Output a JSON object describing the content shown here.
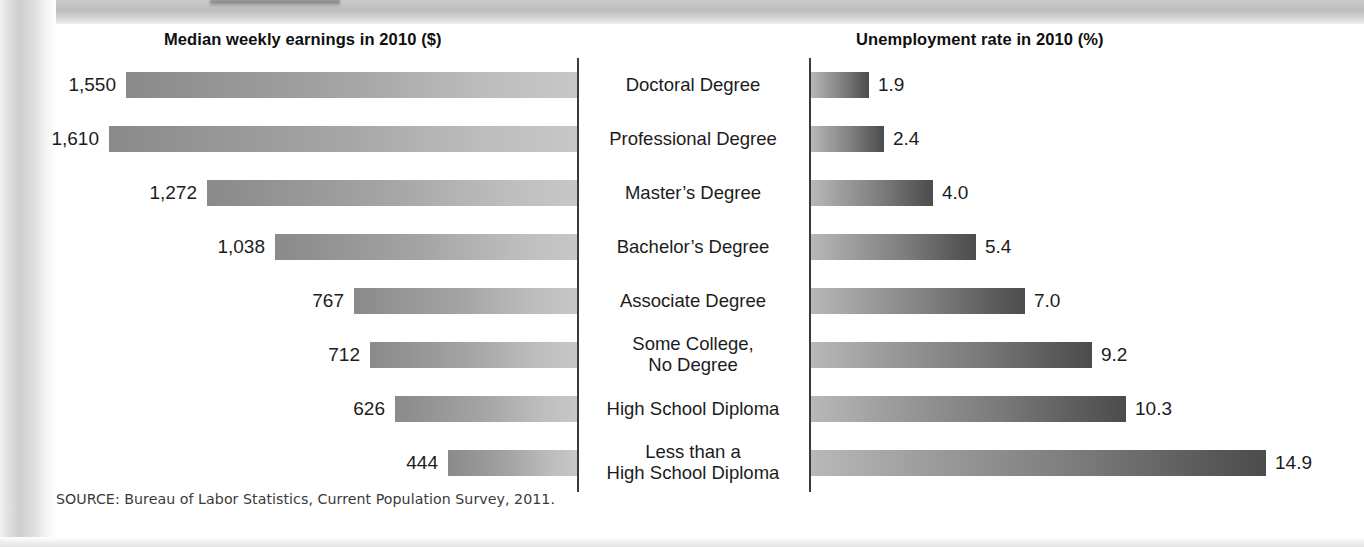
{
  "chart_data": {
    "type": "bar",
    "panels": [
      {
        "title": "Median weekly earnings in 2010 ($)",
        "direction": "rtl",
        "unit": "$",
        "max": 1610
      },
      {
        "title": "Unemployment rate in 2010 (%)",
        "direction": "ltr",
        "unit": "%",
        "max": 14.9
      }
    ],
    "categories": [
      "Doctoral Degree",
      "Professional Degree",
      "Master's Degree",
      "Bachelor's Degree",
      "Associate Degree",
      "Some College,\nNo Degree",
      "High School Diploma",
      "Less than a\nHigh School Diploma"
    ],
    "series": [
      {
        "name": "Median weekly earnings in 2010 ($)",
        "values": [
          1550,
          1610,
          1272,
          1038,
          767,
          712,
          626,
          444
        ],
        "labels": [
          "1,550",
          "1,610",
          "1,272",
          "1,038",
          "767",
          "712",
          "626",
          "444"
        ]
      },
      {
        "name": "Unemployment rate in 2010 (%)",
        "values": [
          1.9,
          2.4,
          4.0,
          5.4,
          7.0,
          9.2,
          10.3,
          14.9
        ],
        "labels": [
          "1.9",
          "2.4",
          "4.0",
          "5.4",
          "7.0",
          "9.2",
          "10.3",
          "14.9"
        ]
      }
    ],
    "xlabel": "",
    "ylabel": "",
    "grid": false,
    "legend": "none",
    "source": "SOURCE: Bureau of Labor Statistics, Current Population Survey, 2011."
  },
  "titles": {
    "left": "Median weekly earnings in 2010 ($)",
    "right": "Unemployment rate in 2010 (%)"
  },
  "categories": [
    {
      "label": "Doctoral Degree",
      "line1": "Doctoral Degree",
      "line2": ""
    },
    {
      "label": "Professional Degree",
      "line1": "Professional Degree",
      "line2": ""
    },
    {
      "label": "Master's Degree",
      "line1": "Master’s Degree",
      "line2": ""
    },
    {
      "label": "Bachelor's Degree",
      "line1": "Bachelor’s Degree",
      "line2": ""
    },
    {
      "label": "Associate Degree",
      "line1": "Associate Degree",
      "line2": ""
    },
    {
      "label": "Some College, No Degree",
      "line1": "Some College,",
      "line2": "No Degree"
    },
    {
      "label": "High School Diploma",
      "line1": "High School Diploma",
      "line2": ""
    },
    {
      "label": "Less than a High School Diploma",
      "line1": "Less than a",
      "line2": "High School Diploma"
    }
  ],
  "earnings": [
    {
      "label": "1,550",
      "value": 1550
    },
    {
      "label": "1,610",
      "value": 1610
    },
    {
      "label": "1,272",
      "value": 1272
    },
    {
      "label": "1,038",
      "value": 1038
    },
    {
      "label": "767",
      "value": 767
    },
    {
      "label": "712",
      "value": 712
    },
    {
      "label": "626",
      "value": 626
    },
    {
      "label": "444",
      "value": 444
    }
  ],
  "unemployment": [
    {
      "label": "1.9",
      "value": 1.9
    },
    {
      "label": "2.4",
      "value": 2.4
    },
    {
      "label": "4.0",
      "value": 4.0
    },
    {
      "label": "5.4",
      "value": 5.4
    },
    {
      "label": "7.0",
      "value": 7.0
    },
    {
      "label": "9.2",
      "value": 9.2
    },
    {
      "label": "10.3",
      "value": 10.3
    },
    {
      "label": "14.9",
      "value": 14.9
    }
  ],
  "source": "SOURCE: Bureau of Labor Statistics, Current Population Survey, 2011.",
  "colors": {
    "earnings_bar_dark": "#8a8a8a",
    "earnings_bar_light": "#c7c7c7",
    "unemployment_bar_light": "#b8b8b8",
    "unemployment_bar_dark": "#4c4c4c",
    "divider": "#3a3a3a",
    "text": "#1c1c1c",
    "source_text": "#3a3a3a"
  }
}
